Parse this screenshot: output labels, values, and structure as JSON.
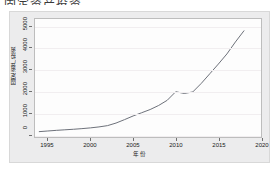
{
  "page": {
    "cropped_header_text": "固定资产投资"
  },
  "chart_data": {
    "type": "line",
    "title": "",
    "xlabel": "年份",
    "ylabel": "固定资产投资",
    "xlim": [
      1993.5,
      2020
    ],
    "ylim": [
      -150,
      5350
    ],
    "xticks": [
      1995,
      2000,
      2005,
      2010,
      2015,
      2020
    ],
    "yticks": [
      0,
      1000,
      2000,
      3000,
      4000,
      5000
    ],
    "grid": true,
    "legend": "none",
    "line_color": "#6b6f78",
    "series": [
      {
        "name": "固定资产投资",
        "x": [
          1994,
          1995,
          1996,
          1997,
          1998,
          1999,
          2000,
          2001,
          2002,
          2003,
          2004,
          2005,
          2006,
          2007,
          2008,
          2009,
          2010,
          2011,
          2012,
          2013,
          2014,
          2015,
          2016,
          2017,
          2018
        ],
        "values": [
          100,
          130,
          160,
          185,
          210,
          240,
          275,
          320,
          380,
          500,
          660,
          830,
          980,
          1130,
          1320,
          1560,
          1960,
          1880,
          1950,
          2350,
          2800,
          3250,
          3720,
          4280,
          4800
        ]
      }
    ]
  },
  "axis": {
    "ytick_labels": [
      "5000",
      "4000",
      "3000",
      "2000",
      "1000",
      "0"
    ],
    "xtick_labels": [
      "1995",
      "2000",
      "2005",
      "2010",
      "2015",
      "2020"
    ]
  }
}
